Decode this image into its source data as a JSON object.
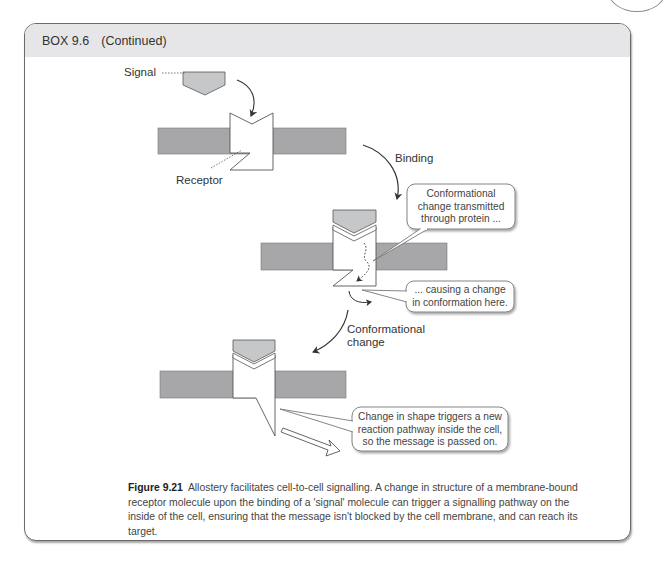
{
  "box": {
    "label": "BOX 9.6",
    "continued": "(Continued)"
  },
  "diagram": {
    "labels": {
      "signal": "Signal",
      "receptor": "Receptor",
      "binding": "Binding",
      "conformational_change_line1": "Conformational",
      "conformational_change_line2": "change"
    },
    "callouts": [
      {
        "lines": [
          "Conformational",
          "change transmitted",
          "through protein ..."
        ]
      },
      {
        "lines": [
          "... causing a change",
          "in conformation here."
        ]
      },
      {
        "lines": [
          "Change in shape triggers a new",
          "reaction pathway inside the cell,",
          "so the message is passed on."
        ]
      }
    ],
    "colors": {
      "membrane": "#a7a7a9",
      "signal_molecule": "#c6c7c9",
      "receptor": "#ffffff",
      "outline": "#4a4a4a"
    }
  },
  "caption": {
    "figure_number": "Figure 9.21",
    "text": "Allostery facilitates cell-to-cell signalling. A change in structure of a membrane-bound receptor molecule upon the binding of a 'signal' molecule can trigger a signalling pathway on the inside of the cell, ensuring that the message isn't blocked by the cell membrane, and can reach its target."
  }
}
